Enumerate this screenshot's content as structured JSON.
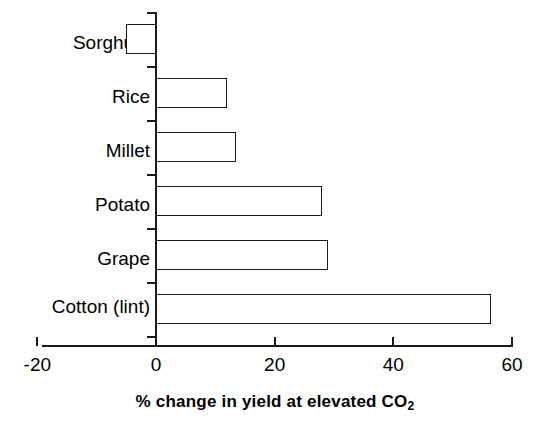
{
  "chart_data": {
    "type": "bar",
    "orientation": "horizontal",
    "title": "",
    "subtitle": "",
    "categories": [
      "Sorghum",
      "Rice",
      "Millet",
      "Potato",
      "Grape",
      "Cotton (lint)"
    ],
    "values": [
      -5,
      12,
      13.5,
      28,
      29,
      56.5
    ],
    "series": [
      {
        "name": "% change in yield at elevated CO2",
        "values": [
          -5,
          12,
          13.5,
          28,
          29,
          56.5
        ]
      }
    ],
    "xlabel": "% change in yield at elevated CO",
    "xlabel_subscript": "2",
    "xlabel_full": "% change in yield at elevated CO2",
    "ylabel": "",
    "xlim": [
      -20,
      60
    ],
    "x_ticks": [
      -20,
      0,
      20,
      40,
      60
    ],
    "x_tick_labels": [
      "-20",
      "0",
      "20",
      "40",
      "60"
    ],
    "grid": false,
    "legend": "none",
    "bar_fill_color": "#ffffff",
    "bar_edge_color": "#1a1a1a",
    "background_color": "#ffffff",
    "text_color": "#000000"
  },
  "axis": {
    "x_label_prefix": "% change in yield at elevated CO",
    "x_label_sub": "2"
  }
}
